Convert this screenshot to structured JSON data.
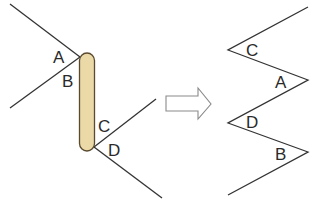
{
  "colors": {
    "line": "#333333",
    "rod_fill": "#ecd9a8",
    "rod_stroke": "#5a4a30",
    "arrow_stroke": "#8a8a8a",
    "background": "#ffffff"
  },
  "left_figure": {
    "description": "Two pairs of lines meeting a vertical rod, forming angles A, B at top and C, D at bottom",
    "labels": {
      "A": "A",
      "B": "B",
      "C": "C",
      "D": "D"
    }
  },
  "arrow": {
    "icon": "right-arrow-outline-icon"
  },
  "right_figure": {
    "description": "Zigzag line with angles labeled C, A, D, B from top to bottom",
    "labels": {
      "C": "C",
      "A": "A",
      "D": "D",
      "B": "B"
    }
  }
}
